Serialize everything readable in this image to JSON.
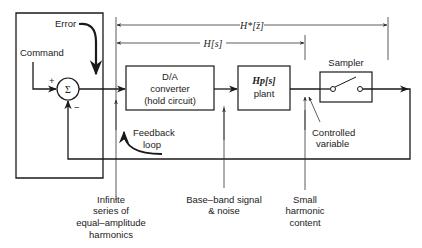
{
  "diagram": {
    "type": "block-diagram",
    "colors": {
      "ink": "#1a1a1a",
      "background": "#ffffff"
    },
    "spans": {
      "outer": "H*[z̄]",
      "inner": "H[s]"
    },
    "inputs": {
      "command": "Command",
      "error": "Error",
      "plus": "+",
      "minus": "−"
    },
    "blocks": {
      "summing_junction": "Σ",
      "da_converter": {
        "line1": "D/A",
        "line2": "converter",
        "line3": "(hold circuit)"
      },
      "plant": {
        "math": "Hp[s]",
        "label": "plant"
      },
      "sampler": {
        "title": "Sampler"
      }
    },
    "annotations": {
      "feedback": {
        "line1": "Feedback",
        "line2": "loop"
      },
      "controlled_variable": {
        "line1": "Controlled",
        "line2": "variable"
      },
      "infinite_series": {
        "line1": "Infinite",
        "line2": "series of",
        "line3": "equal–amplitude",
        "line4": "harmonics"
      },
      "baseband": {
        "line1": "Base–band signal",
        "line2": "& noise"
      },
      "small_harmonic": {
        "line1": "Small",
        "line2": "harmonic",
        "line3": "content"
      }
    }
  }
}
